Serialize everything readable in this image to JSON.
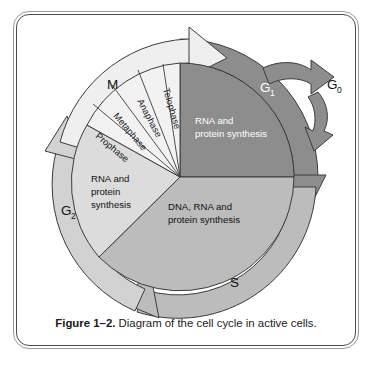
{
  "figure": {
    "caption_label": "Figure 1–2.",
    "caption_text": "Diagram of the cell cycle in active cells."
  },
  "colors": {
    "g1_fill": "#8d8d8d",
    "s_fill": "#bcbcbc",
    "g2_fill": "#dcdcdc",
    "m_fill": "#f2f2f2",
    "ring_g1": "#8d8d8d",
    "ring_s": "#bcbcbc",
    "ring_g2": "#d2d2d2",
    "ring_m": "#efefef",
    "outline": "#3c3c3c",
    "frame_outer": "#9b9b9b",
    "frame_inner": "#4c4c4c",
    "text_dark": "#111111",
    "text_light": "#ffffff",
    "page_background": "#ffffff"
  },
  "phases": [
    {
      "id": "g1",
      "label": "G",
      "subscript": "1",
      "description_lines": [
        "RNA and",
        "protein synthesis"
      ],
      "fill": "#8d8d8d",
      "text_color": "#ffffff"
    },
    {
      "id": "s",
      "label": "S",
      "subscript": "",
      "description_lines": [
        "DNA, RNA and",
        "protein synthesis"
      ],
      "fill": "#bcbcbc",
      "text_color": "#111111"
    },
    {
      "id": "g2",
      "label": "G",
      "subscript": "2",
      "description_lines": [
        "RNA and",
        "protein",
        "synthesis"
      ],
      "fill": "#dcdcdc",
      "text_color": "#111111"
    },
    {
      "id": "m",
      "label": "M",
      "subscript": "",
      "description_lines": [],
      "fill": "#f2f2f2",
      "text_color": "#111111"
    }
  ],
  "mitosis_stages": [
    {
      "id": "prophase",
      "label": "Prophase"
    },
    {
      "id": "metaphase",
      "label": "Metaphase"
    },
    {
      "id": "anaphase",
      "label": "Anaphase"
    },
    {
      "id": "telophase",
      "label": "Telophase"
    }
  ],
  "quiescent": {
    "label": "G",
    "subscript": "0",
    "exit_arrow": "arrow-exit-to-g0",
    "entry_arrow": "arrow-reentry-from-g0"
  },
  "g1_text": {
    "line1": "RNA and",
    "line2": "protein synthesis"
  },
  "s_text": {
    "line1": "DNA, RNA and",
    "line2": "protein synthesis"
  },
  "g2_text": {
    "line1": "RNA and",
    "line2": "protein",
    "line3": "synthesis"
  }
}
